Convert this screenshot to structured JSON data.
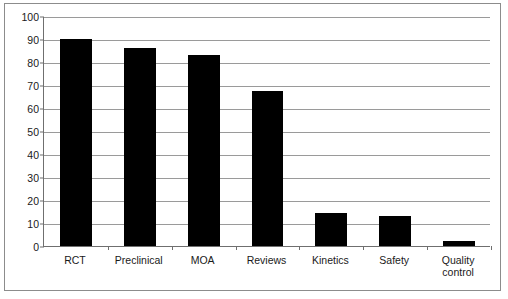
{
  "chart_data": {
    "type": "bar",
    "title": "359 studies with S. boulardii",
    "title_plain": "359 studies with ",
    "title_species": "S. boulardii",
    "xlabel": "",
    "ylabel": "",
    "ylim": [
      0,
      100
    ],
    "ytick_step": 10,
    "grid": true,
    "legend": "none",
    "bar_color": "#000000",
    "categories": [
      "RCT",
      "Preclinical",
      "MOA",
      "Reviews",
      "Kinetics",
      "Safety",
      "Quality control"
    ],
    "values": [
      90,
      86,
      83,
      67.5,
      14.5,
      13,
      2
    ],
    "yticks": [
      "0",
      "10",
      "20",
      "30",
      "40",
      "50",
      "60",
      "70",
      "80",
      "90",
      "100"
    ],
    "category_labels": [
      {
        "line1": "RCT",
        "line2": ""
      },
      {
        "line1": "Preclinical",
        "line2": ""
      },
      {
        "line1": "MOA",
        "line2": ""
      },
      {
        "line1": "Reviews",
        "line2": ""
      },
      {
        "line1": "Kinetics",
        "line2": ""
      },
      {
        "line1": "Safety",
        "line2": ""
      },
      {
        "line1": "Quality",
        "line2": "control"
      }
    ]
  },
  "colors": {
    "bar": "#000000",
    "gridline": "#9a9a9a",
    "axis": "#6f6f6f",
    "frame": "#8c8c8c",
    "text": "#1a1a1a",
    "background": "#ffffff"
  }
}
